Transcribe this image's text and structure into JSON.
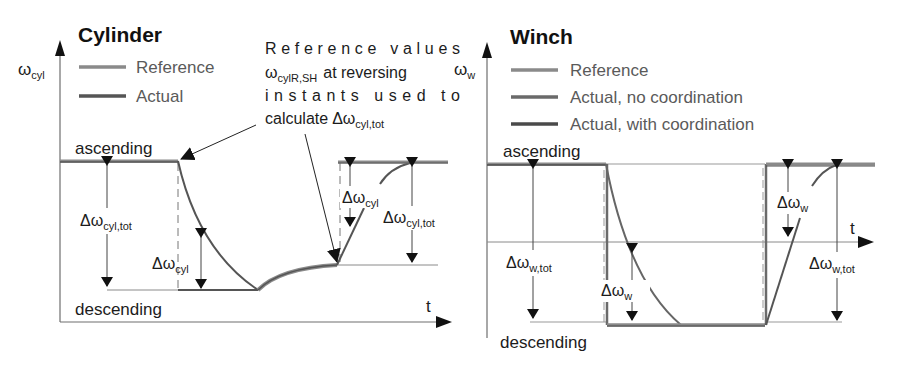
{
  "panels": {
    "cylinder": {
      "title": "Cylinder",
      "y_axis_symbol": "ω",
      "y_axis_sub": "cyl",
      "x_axis_label": "t",
      "legend": [
        {
          "label": "Reference",
          "color": "#8a8a8a"
        },
        {
          "label": "Actual",
          "color": "#555555"
        }
      ],
      "level_high": "ascending",
      "level_low": "descending",
      "delta_tot_symbol": "Δω",
      "delta_tot_sub": "cyl,tot",
      "delta_symbol": "Δω",
      "delta_sub": "cyl",
      "callout": {
        "line1": "Reference values",
        "line2_symbol": "ω",
        "line2_sub": "cylR,SH",
        "line2_rest": "at reversing",
        "line3": "instants used to",
        "line4_text": "calculate",
        "line4_symbol": "Δω",
        "line4_sub": "cyl,tot"
      }
    },
    "winch": {
      "title": "Winch",
      "y_axis_symbol": "ω",
      "y_axis_sub": "w",
      "x_axis_label": "t",
      "legend": [
        {
          "label": "Reference",
          "color": "#8a8a8a"
        },
        {
          "label": "Actual, no coordination",
          "color": "#6a6a6a"
        },
        {
          "label": "Actual, with coordination",
          "color": "#4a4a4a"
        }
      ],
      "level_high": "ascending",
      "level_low": "descending",
      "delta_tot_symbol": "Δω",
      "delta_tot_sub": "w,tot",
      "delta_symbol": "Δω",
      "delta_sub": "w"
    }
  },
  "colors": {
    "axis": "#6e6e6e",
    "reference": "#8a8a8a",
    "actual": "#555555",
    "text": "#1c1c1c"
  }
}
